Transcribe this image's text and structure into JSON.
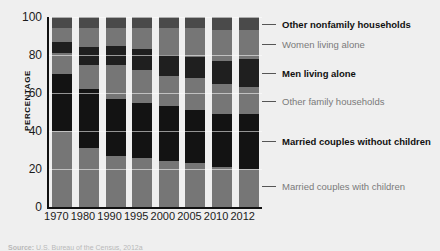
{
  "chart_data": {
    "type": "bar",
    "subtype": "stacked-bar-100",
    "title": "",
    "xlabel": "",
    "ylabel": "PERCENTAGE",
    "ylim": [
      0,
      100
    ],
    "yticks": [
      0,
      20,
      40,
      60,
      80,
      100
    ],
    "grid": true,
    "legend_position": "right",
    "categories": [
      "1970",
      "1980",
      "1990",
      "1995",
      "2000",
      "2005",
      "2010",
      "2012"
    ],
    "series": [
      {
        "name": "Married couples with children",
        "color": "#767676",
        "label_style": "gray",
        "values": [
          40,
          31,
          27,
          26,
          24,
          23,
          21,
          20
        ]
      },
      {
        "name": "Married couples without children",
        "color": "#131313",
        "label_style": "dark",
        "values": [
          30,
          31,
          30,
          29,
          29,
          28,
          28,
          29
        ]
      },
      {
        "name": "Other family households",
        "color": "#767676",
        "label_style": "gray",
        "values": [
          11,
          13,
          18,
          17,
          16,
          17,
          16,
          14
        ]
      },
      {
        "name": "Men living alone",
        "color": "#1f1f1f",
        "label_style": "dark",
        "values": [
          6,
          9,
          10,
          11,
          11,
          11,
          12,
          15
        ]
      },
      {
        "name": "Women living alone",
        "color": "#767676",
        "label_style": "gray",
        "values": [
          7,
          10,
          9,
          11,
          14,
          15,
          16,
          15
        ]
      },
      {
        "name": "Other nonfamily households",
        "color": "#4a4a4a",
        "label_style": "dark",
        "values": [
          6,
          6,
          6,
          6,
          6,
          6,
          7,
          7
        ]
      }
    ]
  },
  "legend": {
    "items": [
      {
        "label": "Other nonfamily households",
        "anchor": 96.5,
        "style": "dark"
      },
      {
        "label": "Women living alone",
        "anchor": 86.0,
        "style": "gray"
      },
      {
        "label": "Men living alone",
        "anchor": 70.5,
        "style": "dark"
      },
      {
        "label": "Other family households",
        "anchor": 56.0,
        "style": "gray"
      },
      {
        "label": "Married couples without children",
        "anchor": 34.5,
        "style": "dark"
      },
      {
        "label": "Married couples with children",
        "anchor": 11.0,
        "style": "gray"
      }
    ]
  },
  "source": {
    "label": "Source:",
    "text": "U.S. Bureau of the Census, 2012a"
  }
}
